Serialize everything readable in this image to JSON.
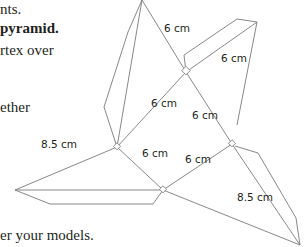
{
  "text_fragments": [
    {
      "text": "nts.",
      "x": 0,
      "y": 1
    },
    {
      "text": "pyramid.",
      "x": 0,
      "y": 20,
      "bold": true,
      "prefix": ""
    },
    {
      "text": "rtex over",
      "x": 0,
      "y": 42
    },
    {
      "text": "ether",
      "x": 0,
      "y": 99
    },
    {
      "text": "er your models.",
      "x": 0,
      "y": 228
    }
  ],
  "diagram": {
    "labels": {
      "top_left_6": "6 cm",
      "top_right_6": "6 cm",
      "center_6": "6 cm",
      "mid_left_8_5": "8.5 cm",
      "mid_6": "6 cm",
      "lower_mid_6": "6 cm",
      "right_8_5": "8.5 cm"
    },
    "line_color": "#7a7a7a"
  }
}
